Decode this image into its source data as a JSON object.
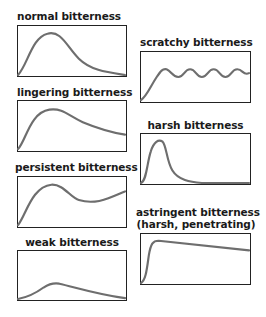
{
  "diagram": {
    "panels": [
      {
        "id": "normal",
        "title": "normal bitterness",
        "curve": "rise to early peak, gradual decay to zero"
      },
      {
        "id": "scratchy",
        "title": "scratchy bitterness",
        "curve": "rise then sustained oscillation"
      },
      {
        "id": "lingering",
        "title": "lingering bitterness",
        "curve": "rise to peak, slow decay staying elevated"
      },
      {
        "id": "harsh",
        "title": "harsh bitterness",
        "curve": "sharp early narrow peak, fast decay"
      },
      {
        "id": "persistent",
        "title": "persistent bitterness",
        "curve": "rise to peak, dip, then rise again"
      },
      {
        "id": "astringent",
        "title_line1": "astringent bitterness",
        "title_line2": "(harsh, penetrating)",
        "curve": "very steep rise to plateau, slow decline"
      },
      {
        "id": "weak",
        "title": "weak bitterness",
        "curve": "low gentle hump"
      }
    ],
    "colors": {
      "curve": "#6e6e6e",
      "border": "#222222",
      "text": "#1a1a1a"
    }
  }
}
